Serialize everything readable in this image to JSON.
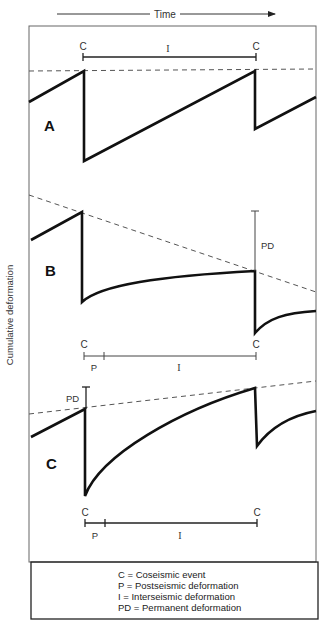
{
  "time_axis": {
    "label": "Time"
  },
  "y_axis": {
    "label": "Cumulative deformation"
  },
  "panels": {
    "A": {
      "label": "A",
      "top_markers": {
        "c1": "C",
        "c2": "C",
        "interval": "I"
      }
    },
    "B": {
      "label": "B",
      "pd_label": "PD",
      "bottom_markers": {
        "c1": "C",
        "c2": "C",
        "post": "P",
        "inter": "I"
      }
    },
    "C": {
      "label": "C",
      "pd_label": "PD",
      "bottom_markers": {
        "c1": "C",
        "c2": "C",
        "post": "P",
        "inter": "I"
      }
    }
  },
  "legend": {
    "items": [
      "C = Coseismic event",
      "P = Postseismic deformation",
      "I = Interseismic deformation",
      "PD = Permanent deformation"
    ]
  },
  "colors": {
    "curve": "#111111",
    "dashed": "#555555",
    "frame": "#555555"
  }
}
